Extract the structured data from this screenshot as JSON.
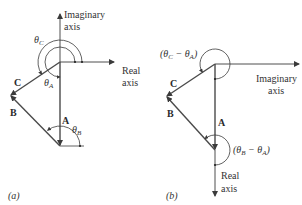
{
  "figure": {
    "panels": [
      {
        "id": "a",
        "caption": "(a)",
        "axes": {
          "vertical_label_line1": "Imaginary",
          "vertical_label_line2": "axis",
          "horizontal_label_line1": "Real",
          "horizontal_label_line2": "axis"
        },
        "vectors": {
          "A": "A",
          "B": "B",
          "C": "C"
        },
        "angles": {
          "theta_C": {
            "sym": "θ",
            "sub": "C"
          },
          "theta_A": {
            "sym": "θ",
            "sub": "A"
          },
          "theta_B": {
            "sym": "θ",
            "sub": "B"
          }
        }
      },
      {
        "id": "b",
        "caption": "(b)",
        "axes": {
          "horizontal_label_line1": "Imaginary",
          "horizontal_label_line2": "axis",
          "vertical_label_line1": "Real",
          "vertical_label_line2": "axis"
        },
        "vectors": {
          "A": "A",
          "B": "B",
          "C": "C"
        },
        "angles": {
          "theta_C_minus_A": {
            "open": "(",
            "s1": "θ",
            "sub1": "C",
            "minus": " − ",
            "s2": "θ",
            "sub2": "A",
            "close": ")"
          },
          "theta_B_minus_A": {
            "open": "(",
            "s1": "θ",
            "sub1": "B",
            "minus": " − ",
            "s2": "θ",
            "sub2": "A",
            "close": ")"
          }
        }
      }
    ],
    "colors": {
      "axis": "#3a3a3a",
      "vector": "#4a4a4a",
      "background": "#ffffff"
    }
  }
}
